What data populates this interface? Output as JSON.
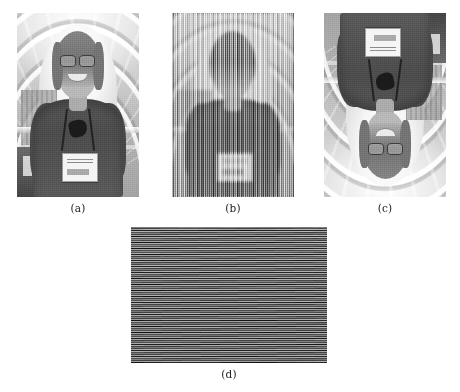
{
  "figure": {
    "kind": "multi-panel-image-figure",
    "background_color": "#ffffff",
    "caption_color": "#1c1c1c",
    "panels": [
      {
        "id": "a",
        "label": "(a)",
        "description": "Grayscale photograph of a smiling woman wearing glasses, a dark short-sleeved shirt, a lanyard with sunglasses and a conference name badge, standing beneath an arched glass-and-steel roof with a city skyline visible behind her.",
        "content_type": "photograph",
        "orientation": "upright",
        "artifact": "none"
      },
      {
        "id": "b",
        "label": "(b)",
        "description": "The same photograph severely undersampled, producing strong vertical-stripe aliasing (moire) that obscures the subject; only the dark torso and light face region remain faintly discernible.",
        "content_type": "aliased-photograph",
        "orientation": "upright",
        "artifact": "vertical-moire"
      },
      {
        "id": "c",
        "label": "(c)",
        "description": "The same photograph rotated 180 degrees, showing the woman upside down with the name badge and arched roof inverted.",
        "content_type": "photograph",
        "orientation": "rotated-180",
        "artifact": "none"
      },
      {
        "id": "d",
        "label": "(d)",
        "description": "An extreme close-up crop resampled at low rate, producing dense horizontal-stripe aliasing bands with a bright upper half fading into a dark lower half.",
        "content_type": "aliased-photograph",
        "orientation": "upright",
        "artifact": "horizontal-moire"
      }
    ]
  }
}
